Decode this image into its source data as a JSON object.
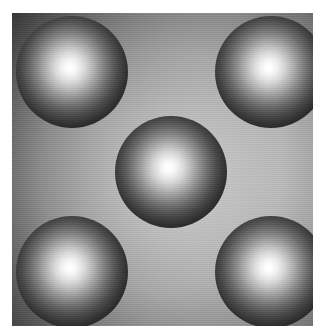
{
  "image": {
    "kind": "rendered-image",
    "description": "Grayscale computer-graphics render of five diffusely lit spheres arranged in a quincunx on a graded backdrop",
    "width_px": 325,
    "height_px": 336,
    "canvas": {
      "left_px": 12,
      "top_px": 13,
      "width_px": 301,
      "height_px": 313
    },
    "paper_margin_color": "#ffffff",
    "palette": {
      "highlight": "#ffffff",
      "sphere_midtone": "#6b6b6b",
      "sphere_terminator": "#050505",
      "background_dark": "#3a3a3a",
      "background_light": "#949494"
    },
    "lighting": {
      "model": "point-light diffuse falloff",
      "highlight_position": "48% 46%",
      "background_light_center": "52% 52%"
    },
    "spheres": [
      {
        "id": "sphere-top-left",
        "label": "Top-left sphere",
        "center_x": 72,
        "center_y": 72,
        "radius_px": 56
      },
      {
        "id": "sphere-top-right",
        "label": "Top-right sphere",
        "center_x": 271,
        "center_y": 72,
        "radius_px": 56
      },
      {
        "id": "sphere-center",
        "label": "Center sphere",
        "center_x": 171,
        "center_y": 172,
        "radius_px": 56
      },
      {
        "id": "sphere-bottom-left",
        "label": "Bottom-left sphere",
        "center_x": 72,
        "center_y": 272,
        "radius_px": 56
      },
      {
        "id": "sphere-bottom-right",
        "label": "Bottom-right sphere",
        "center_x": 271,
        "center_y": 272,
        "radius_px": 56
      }
    ]
  }
}
